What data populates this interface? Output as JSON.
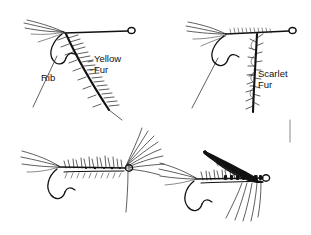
{
  "figure": {
    "background_color": "#ffffff",
    "ink_color": "#111111",
    "width": 311,
    "height": 235,
    "style": "black ink line drawing"
  },
  "labels": [
    {
      "id": "rib",
      "text": "Rib",
      "x": 41,
      "y": 81
    },
    {
      "id": "yellow",
      "text": "Yellow",
      "x": 94,
      "y": 62
    },
    {
      "id": "fur_yellow",
      "text": "Fur",
      "x": 94,
      "y": 73
    },
    {
      "id": "scarlet",
      "text": "Scarlet",
      "x": 258,
      "y": 77
    },
    {
      "id": "fur_scarlet",
      "text": "Fur",
      "x": 258,
      "y": 88
    }
  ],
  "flies": [
    {
      "id": "fly-top-left",
      "name": "Palmered fly with rib and yellow fur body",
      "position": "top-left",
      "parts": [
        "wing-fibers",
        "hook-eye",
        "hook-shank",
        "hook-bend",
        "hook-barb",
        "palmered-body",
        "rib-line"
      ],
      "labels": [
        "Rib",
        "Yellow",
        "Fur"
      ]
    },
    {
      "id": "fly-top-right",
      "name": "Palmered fly with scarlet fur body",
      "position": "top-right",
      "parts": [
        "wing-fibers",
        "hook-eye",
        "hook-shank",
        "hook-bend",
        "hook-barb",
        "shaggy-body",
        "rib-line"
      ],
      "labels": [
        "Scarlet",
        "Fur"
      ]
    },
    {
      "id": "fly-bottom-left",
      "name": "Spiky dubbed nymph with splayed hackle",
      "position": "bottom-left",
      "parts": [
        "tail-fibers",
        "hook-eye",
        "hook-shank",
        "hook-bend",
        "hook-barb",
        "dubbed-body",
        "hackle-fan",
        "trailing-line"
      ],
      "labels": []
    },
    {
      "id": "fly-bottom-right",
      "name": "Winged wet fly with swept wing and leg fibers",
      "position": "bottom-right",
      "parts": [
        "tail-fibers",
        "hook-eye",
        "hook-shank",
        "hook-bend",
        "hook-barb",
        "segmented-body",
        "swept-wing",
        "leg-fibers"
      ],
      "labels": []
    }
  ]
}
